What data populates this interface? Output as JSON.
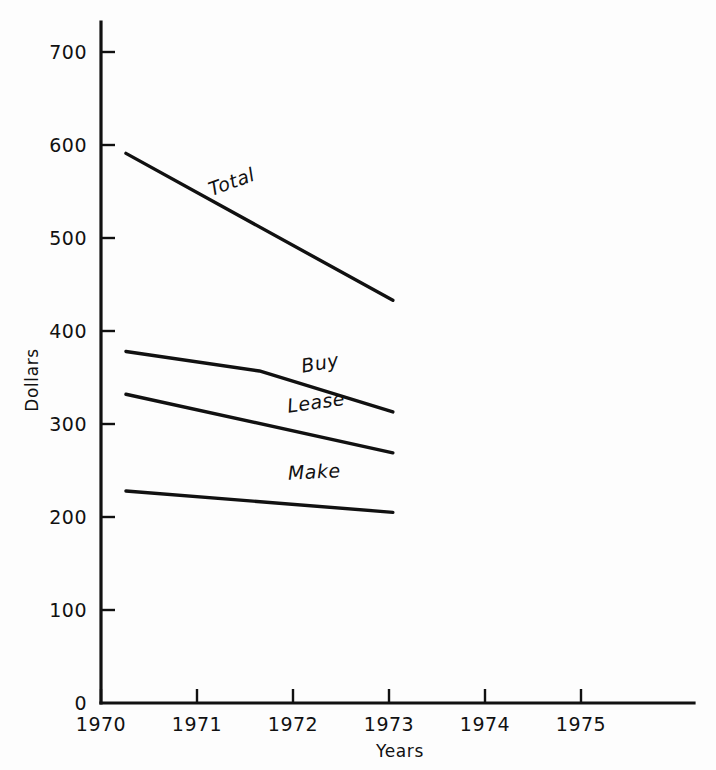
{
  "chart_data": {
    "type": "line",
    "title": "",
    "xlabel": "Years",
    "ylabel": "Dollars",
    "xlim": [
      1969.4,
      1975.4
    ],
    "ylim": [
      0,
      730
    ],
    "grid": false,
    "legend_position": "inline-labels",
    "x_ticks": [
      "1970",
      "1971",
      "1972",
      "1973",
      "1974",
      "1975"
    ],
    "x_tick_values": [
      1970,
      1971,
      1972,
      1973,
      1974,
      1975
    ],
    "y_ticks": [
      "0",
      "100",
      "200",
      "300",
      "400",
      "500",
      "600",
      "700"
    ],
    "y_tick_values": [
      0,
      100,
      200,
      300,
      400,
      500,
      600,
      700
    ],
    "series": [
      {
        "name": "Total",
        "x": [
          1970.26,
          1973.04
        ],
        "values": [
          591,
          433
        ],
        "label": "Total",
        "label_x": 1971.15,
        "label_y": 545,
        "label_rotation": -20
      },
      {
        "name": "Buy",
        "x": [
          1970.26,
          1971.65,
          1973.04
        ],
        "values": [
          378,
          357,
          313
        ],
        "label": "Buy",
        "label_x": 1972.1,
        "label_y": 355,
        "label_rotation": -10
      },
      {
        "name": "Lease",
        "x": [
          1970.26,
          1973.04
        ],
        "values": [
          332,
          269
        ],
        "label": "Lease",
        "label_x": 1971.95,
        "label_y": 312,
        "label_rotation": -8
      },
      {
        "name": "Make",
        "x": [
          1970.26,
          1973.04
        ],
        "values": [
          228,
          205
        ],
        "label": "Make",
        "label_x": 1971.95,
        "label_y": 240,
        "label_rotation": -3
      }
    ]
  },
  "axes": {
    "y_axis_title": "Dollars",
    "x_axis_title": "Years"
  }
}
